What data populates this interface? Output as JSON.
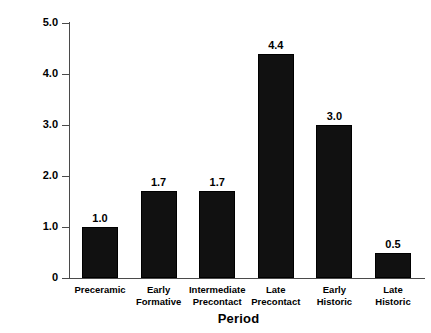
{
  "chart_data": {
    "type": "bar",
    "title": "",
    "xlabel": "Period",
    "ylabel": "Percentage",
    "categories": [
      "Preceramic",
      "Early Formative",
      "Intermediate Precontact",
      "Late Precontact",
      "Early Historic",
      "Late Historic"
    ],
    "category_lines": [
      [
        "Preceramic",
        ""
      ],
      [
        "Early",
        "Formative"
      ],
      [
        "Intermediate",
        "Precontact"
      ],
      [
        "Late",
        "Precontact"
      ],
      [
        "Early",
        "Historic"
      ],
      [
        "Late",
        "Historic"
      ]
    ],
    "values": [
      1.0,
      1.7,
      1.7,
      4.4,
      3.0,
      0.5
    ],
    "value_labels": [
      "1.0",
      "1.7",
      "1.7",
      "4.4",
      "3.0",
      "0.5"
    ],
    "ylim": [
      0,
      5.0
    ],
    "yticks": [
      0,
      1.0,
      2.0,
      3.0,
      4.0,
      5.0
    ],
    "ytick_labels": [
      "0",
      "1.0",
      "2.0",
      "3.0",
      "4.0",
      "5.0"
    ],
    "grid": false,
    "legend": "none",
    "bar_color": "#111111",
    "background_color": "#ffffff",
    "axis_color": "#4a4a4a"
  }
}
